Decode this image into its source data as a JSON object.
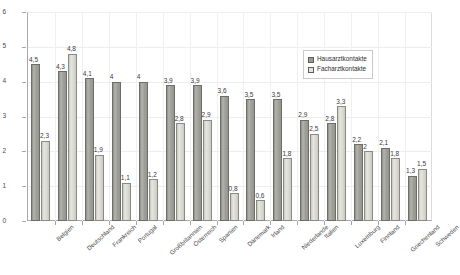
{
  "chart_data": {
    "type": "bar",
    "title": "",
    "subtitle": "",
    "xlabel": "",
    "ylabel": "",
    "ylim": [
      0,
      6
    ],
    "yticks": [
      "0",
      "1",
      "2",
      "3",
      "4",
      "5",
      "6"
    ],
    "grid": true,
    "legend_position": "top-right",
    "categories": [
      "Belgien",
      "Deutschland",
      "Frankreich",
      "Portugal",
      "Großbritannien",
      "Österreich",
      "Spanien",
      "Dänemark",
      "Irland",
      "Niederlande",
      "Italien",
      "Luxemburg",
      "Finnland",
      "Griechenland",
      "Schweden"
    ],
    "series": [
      {
        "name": "Hausarztkontakte",
        "color": "#9b9b95",
        "values": [
          4.5,
          4.3,
          4.1,
          4,
          4,
          3.9,
          3.9,
          3.6,
          3.5,
          3.5,
          2.9,
          2.8,
          2.2,
          2.1,
          1.3
        ],
        "labels": [
          "4,5",
          "4,3",
          "4,1",
          "4",
          "4",
          "3,9",
          "3,9",
          "3,6",
          "3,5",
          "3,5",
          "2,9",
          "2,8",
          "2,2",
          "2,1",
          "1,3"
        ]
      },
      {
        "name": "Facharztkontakte",
        "color": "#e4e4dc",
        "values": [
          2.3,
          4.8,
          1.9,
          1.1,
          1.2,
          2.8,
          2.9,
          0.8,
          0.6,
          1.8,
          2.5,
          3.3,
          2,
          1.8,
          1.5
        ],
        "labels": [
          "2,3",
          "4,8",
          "1,9",
          "1,1",
          "1,2",
          "2,8",
          "2,9",
          "0,8",
          "0,6",
          "1,8",
          "2,5",
          "3,3",
          "2",
          "1,8",
          "1,5"
        ]
      }
    ]
  },
  "legend": {
    "entries": [
      {
        "label": "Hausarztkontakte",
        "swatch": "legend-swatch-primary"
      },
      {
        "label": "Facharztkontakte",
        "swatch": "legend-swatch-secondary"
      }
    ]
  }
}
